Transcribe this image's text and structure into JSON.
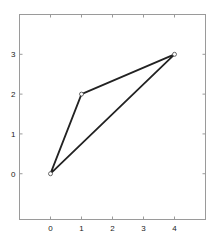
{
  "chart_data": {
    "type": "line",
    "title": "",
    "xlabel": "",
    "ylabel": "",
    "xlim": [
      -1,
      5
    ],
    "ylim": [
      -1.15,
      4
    ],
    "grid": false,
    "legend": null,
    "xticks": [
      0,
      1,
      2,
      3,
      4
    ],
    "yticks": [
      0,
      1,
      2,
      3
    ],
    "xtick_labels": [
      "0",
      "1",
      "2",
      "3",
      "4"
    ],
    "ytick_labels": [
      "0",
      "1",
      "2",
      "3"
    ],
    "series": [
      {
        "name": "triangle",
        "x": [
          0,
          1,
          4,
          0
        ],
        "y": [
          0,
          2,
          3,
          0
        ],
        "closed": true,
        "marker": "circle",
        "color": "#222222"
      }
    ]
  },
  "style": {
    "axes_color": "#9a9a9a",
    "line_color": "#222222",
    "marker_color": "#444444",
    "background": "#ffffff"
  }
}
